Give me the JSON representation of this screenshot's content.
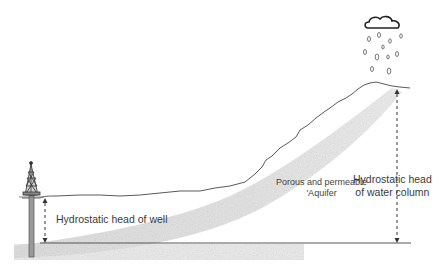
{
  "diagram": {
    "type": "artesian-aquifer-cross-section",
    "labels": {
      "well_head": "Hydrostatic head of well",
      "column_head_line1": "Hydrostatic head",
      "column_head_line2": "of water column",
      "aquifer_line1": "Porous and permeable",
      "aquifer_line2": "'Aquifer"
    },
    "elements": [
      "drilling-rig",
      "well-casing",
      "ground-surface",
      "hill-slope",
      "aquifer-band",
      "rain-cloud",
      "raindrops",
      "datum-line",
      "well-head-arrow",
      "column-head-arrow"
    ],
    "colors": {
      "line": "#555555",
      "aquifer": "#d9d9d9",
      "ground_fill": "#eeeeee",
      "text": "#3a3a3a"
    }
  }
}
